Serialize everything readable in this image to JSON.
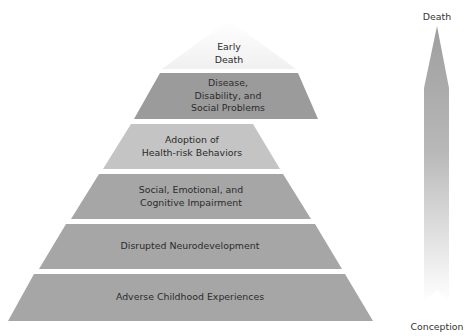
{
  "diagram": {
    "type": "pyramid",
    "apex": {
      "label_lines": [
        "Early",
        "Death"
      ],
      "color": "#f7f7f7"
    },
    "layers": [
      {
        "label_lines": [
          "Disease,",
          "Disability, and",
          "Social Problems"
        ],
        "color": "#9b9b9b"
      },
      {
        "label_lines": [
          "Adoption of",
          "Health-risk Behaviors"
        ],
        "color": "#c4c4c4"
      },
      {
        "label_lines": [
          "Social, Emotional, and",
          "Cognitive Impairment"
        ],
        "color": "#a6a6a6"
      },
      {
        "label_lines": [
          "Disrupted Neurodevelopment"
        ],
        "color": "#a6a6a6"
      },
      {
        "label_lines": [
          "Adverse Childhood Experiences"
        ],
        "color": "#a6a6a6"
      }
    ],
    "timeline_arrow": {
      "top_label": "Death",
      "bottom_label": "Conception",
      "gradient_top": "#9e9e9e",
      "gradient_bottom": "#ffffff"
    }
  }
}
